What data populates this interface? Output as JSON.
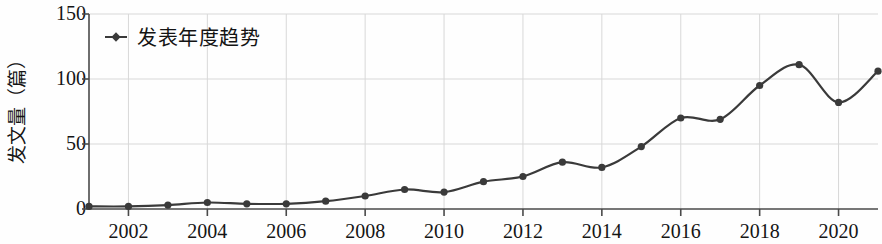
{
  "chart_data": {
    "type": "line",
    "title": "",
    "xlabel": "",
    "ylabel": "发文量（篇）",
    "legend": [
      "发表年度趋势"
    ],
    "legend_position": "top-left-inside",
    "grid": true,
    "marker": "circle",
    "line_color": "#3a3a3a",
    "marker_color": "#3a3a3a",
    "grid_color": "#d8d8d8",
    "axis_color": "#4a4a4a",
    "ylim": [
      0,
      150
    ],
    "y_ticks": [
      "0",
      "50",
      "100",
      "150"
    ],
    "y_tick_values": [
      0,
      50,
      100,
      150
    ],
    "xlim": [
      2001,
      2021
    ],
    "x_ticks": [
      "2002",
      "2004",
      "2006",
      "2008",
      "2010",
      "2012",
      "2014",
      "2016",
      "2018",
      "2020"
    ],
    "x_tick_values": [
      2002,
      2004,
      2006,
      2008,
      2010,
      2012,
      2014,
      2016,
      2018,
      2020
    ],
    "x": [
      2001,
      2002,
      2003,
      2004,
      2005,
      2006,
      2007,
      2008,
      2009,
      2010,
      2011,
      2012,
      2013,
      2014,
      2015,
      2016,
      2017,
      2018,
      2019,
      2020,
      2021
    ],
    "series": [
      {
        "name": "发表年度趋势",
        "values": [
          2,
          2,
          3,
          5,
          4,
          4,
          6,
          10,
          15,
          13,
          21,
          25,
          36,
          32,
          48,
          70,
          69,
          95,
          111,
          82,
          106
        ]
      }
    ]
  }
}
